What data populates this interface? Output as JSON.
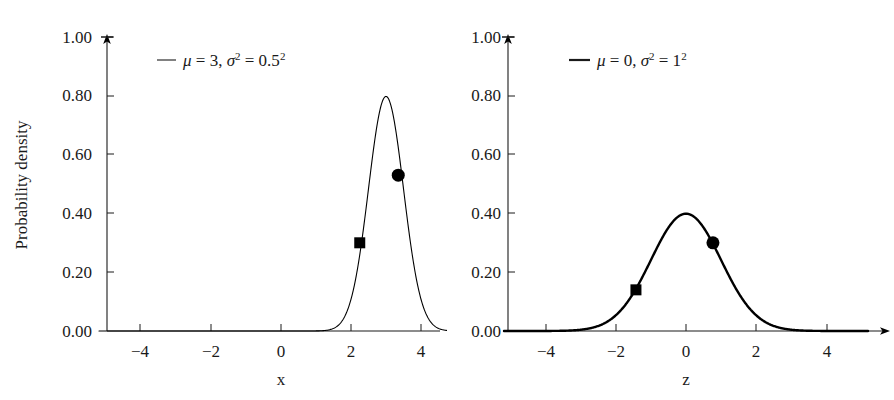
{
  "figure": {
    "background": "#ffffff",
    "ink_color": "#1a1a1a",
    "curve_color": "#000000",
    "marker_color": "#000000"
  },
  "chart_data": [
    {
      "type": "line",
      "panel": "left",
      "title": "",
      "xlabel": "x",
      "ylabel": "Probability density",
      "xlim": [
        -5.2,
        5.2
      ],
      "ylim": [
        0.0,
        1.0
      ],
      "xticks": [
        -4,
        -2,
        0,
        2,
        4
      ],
      "xticklabels": [
        "−4",
        "−2",
        "0",
        "2",
        "4"
      ],
      "yticks": [
        0.0,
        0.2,
        0.4,
        0.6,
        0.8,
        1.0
      ],
      "yticklabels": [
        "0.00",
        "0.20",
        "0.40",
        "0.60",
        "0.80",
        "1.00"
      ],
      "grid": false,
      "legend_position": "upper-center",
      "legend": [
        {
          "marker": "line",
          "label": "μ = 3, σ² = 0.5²",
          "mu_text": "μ",
          "mu_value": 3,
          "sigma_text": "σ",
          "sigma_sq_exponent": "2",
          "sigma_value_text": "0.5",
          "sigma_value_exponent": "2"
        }
      ],
      "series": [
        {
          "name": "normal-mu3-sigma0.5",
          "distribution": "normal",
          "mu": 3,
          "sigma": 0.5,
          "peak_value": 0.8,
          "stroke_width": 1.1
        }
      ],
      "annotations": [
        {
          "marker": "square",
          "x": 2.25,
          "y": 0.3
        },
        {
          "marker": "circle",
          "x": 3.35,
          "y": 0.53
        }
      ]
    },
    {
      "type": "line",
      "panel": "right",
      "title": "",
      "xlabel": "z",
      "ylabel": "",
      "xlim": [
        -5.2,
        5.2
      ],
      "ylim": [
        0.0,
        1.0
      ],
      "xticks": [
        -4,
        -2,
        0,
        2,
        4
      ],
      "xticklabels": [
        "−4",
        "−2",
        "0",
        "2",
        "4"
      ],
      "yticks": [
        0.0,
        0.2,
        0.4,
        0.6,
        0.8,
        1.0
      ],
      "yticklabels": [
        "0.00",
        "0.20",
        "0.40",
        "0.60",
        "0.80",
        "1.00"
      ],
      "grid": false,
      "legend_position": "upper-center",
      "legend": [
        {
          "marker": "line",
          "label": "μ = 0, σ² = 1²",
          "mu_text": "μ",
          "mu_value": 0,
          "sigma_text": "σ",
          "sigma_sq_exponent": "2",
          "sigma_value_text": "1",
          "sigma_value_exponent": "2"
        }
      ],
      "series": [
        {
          "name": "normal-mu0-sigma1",
          "distribution": "normal",
          "mu": 0,
          "sigma": 1,
          "peak_value": 0.4,
          "stroke_width": 2.4
        }
      ],
      "annotations": [
        {
          "marker": "square",
          "x": -1.43,
          "y": 0.14
        },
        {
          "marker": "circle",
          "x": 0.77,
          "y": 0.3
        }
      ]
    }
  ],
  "left_panel": {
    "y_axis_title": "Probability density",
    "x_axis_title": "x",
    "y_tick_labels": [
      "1.00",
      "0.80",
      "0.60",
      "0.40",
      "0.20",
      "0.00"
    ],
    "x_tick_labels": [
      "−4",
      "−2",
      "0",
      "2",
      "4"
    ],
    "legend": {
      "mu": "μ",
      "eq1": " = 3, ",
      "sigma": "σ",
      "sup1": "2",
      "eq2": " = 0.5",
      "sup2": "2"
    }
  },
  "right_panel": {
    "y_axis_title": "",
    "x_axis_title": "z",
    "y_tick_labels": [
      "1.00",
      "0.80",
      "0.60",
      "0.40",
      "0.20",
      "0.00"
    ],
    "x_tick_labels": [
      "−4",
      "−2",
      "0",
      "2",
      "4"
    ],
    "legend": {
      "mu": "μ",
      "eq1": " = 0, ",
      "sigma": "σ",
      "sup1": "2",
      "eq2": " = 1",
      "sup2": "2"
    }
  }
}
